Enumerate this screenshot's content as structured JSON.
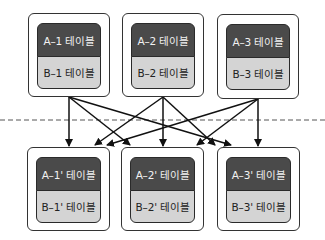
{
  "top_groups": [
    {
      "a_label": "A–1 테이블",
      "b_label": "B–1 테이블"
    },
    {
      "a_label": "A–2 테이블",
      "b_label": "B–2 테이블"
    },
    {
      "a_label": "A–3 테이블",
      "b_label": "B–3 테이블"
    }
  ],
  "bottom_groups": [
    {
      "a_label": "A–1' 테이블",
      "b_label": "B–1' 테이블"
    },
    {
      "a_label": "A–2' 테이블",
      "b_label": "B–2' 테이블"
    },
    {
      "a_label": "A–3' 테이블",
      "b_label": "B–3' 테이블"
    }
  ],
  "connections": [
    {
      "from": "top-1",
      "to": [
        "bottom-1",
        "bottom-2",
        "bottom-3"
      ]
    },
    {
      "from": "top-2",
      "to": [
        "bottom-1",
        "bottom-2",
        "bottom-3"
      ]
    },
    {
      "from": "top-3",
      "to": [
        "bottom-1",
        "bottom-2",
        "bottom-3"
      ]
    }
  ],
  "colors": {
    "a_table_fill": "#4a4a4a",
    "b_table_fill": "#d4d4d4",
    "border": "#333333",
    "divider": "#555555"
  }
}
